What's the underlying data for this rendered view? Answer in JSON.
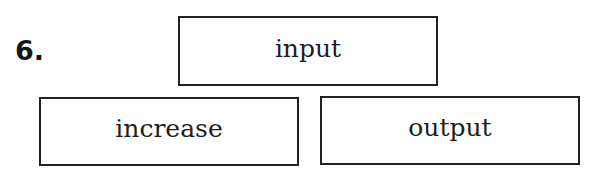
{
  "question": {
    "number": "6."
  },
  "boxes": {
    "top": {
      "label": "input"
    },
    "bottom_left": {
      "label": "increase"
    },
    "bottom_right": {
      "label": "output"
    }
  },
  "colors": {
    "border": "#222222",
    "text": "#1e1e1e",
    "background": "#ffffff"
  }
}
